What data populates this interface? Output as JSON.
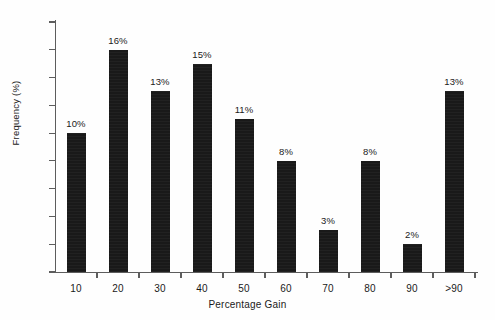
{
  "chart_data": {
    "type": "bar",
    "title": "",
    "xlabel": "Percentage Gain",
    "ylabel": "Frequency (%)",
    "categories": [
      "10",
      "20",
      "30",
      "40",
      "50",
      "60",
      "70",
      "80",
      "90",
      ">90"
    ],
    "values": [
      10,
      16,
      13,
      15,
      11,
      8,
      3,
      8,
      2,
      13
    ],
    "data_labels": [
      "10%",
      "16%",
      "13%",
      "15%",
      "11%",
      "8%",
      "3%",
      "8%",
      "2%",
      "13%"
    ],
    "ylim": [
      0,
      18
    ],
    "ytick_labels": [
      "0",
      "2",
      "4",
      "6",
      "8",
      "10",
      "12",
      "14",
      "16",
      "18"
    ],
    "ytick_values": [
      0,
      2,
      4,
      6,
      8,
      10,
      12,
      14,
      16,
      18
    ],
    "grid": false,
    "legend": null,
    "bar_color": "#191919",
    "axis_color": "#5d5d5d",
    "background_color": "#fefefe"
  }
}
